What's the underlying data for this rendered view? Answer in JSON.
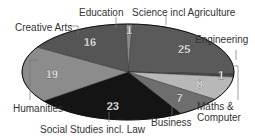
{
  "chart_data": {
    "type": "pie",
    "title": "",
    "total": 100,
    "slices": [
      {
        "label": "Education",
        "value": 1,
        "color": "#8a8a8a"
      },
      {
        "label": "Science incl Agriculture",
        "value": 25,
        "color": "#5a5a5a"
      },
      {
        "label": "Engineering",
        "value": 1,
        "color": "#4a4a4a"
      },
      {
        "label": "Maths & Computer",
        "value": 8,
        "color": "#b8b8b8"
      },
      {
        "label": "Business",
        "value": 7,
        "color": "#6e6e6e"
      },
      {
        "label": "Social Studies incl. Law",
        "value": 23,
        "color": "#141414"
      },
      {
        "label": "Humanities",
        "value": 19,
        "color": "#8c8c8c"
      },
      {
        "label": "Creative Arts",
        "value": 16,
        "color": "#555555"
      }
    ]
  },
  "labels": {
    "education": "Education",
    "science": "Science incl Agriculture",
    "engineering": "Engineering",
    "maths_line1": "Maths &",
    "maths_line2": "Computer",
    "business": "Business",
    "social": "Social Studies incl. Law",
    "humanities": "Humanities",
    "creative": "Creative Arts"
  }
}
